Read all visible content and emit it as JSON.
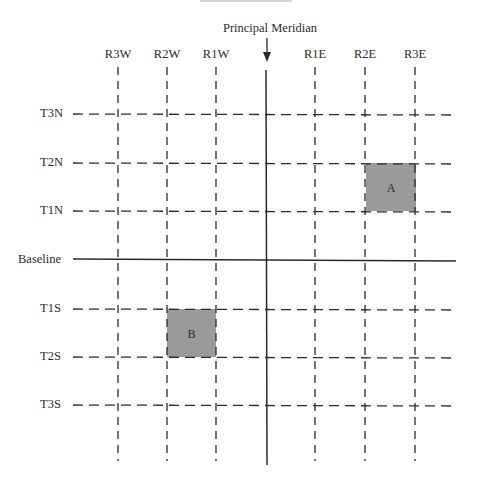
{
  "diagram": {
    "principal_meridian": {
      "label": "Principal Meridian",
      "x": 266,
      "arrow": "down-arrow"
    },
    "baseline": {
      "label": "Baseline",
      "y": 260
    },
    "ranges": [
      {
        "label": "R3W",
        "x": 118
      },
      {
        "label": "R2W",
        "x": 167
      },
      {
        "label": "R1W",
        "x": 216
      },
      {
        "label": "R1E",
        "x": 315
      },
      {
        "label": "R2E",
        "x": 365
      },
      {
        "label": "R3E",
        "x": 415
      }
    ],
    "townships": [
      {
        "label": "T3N",
        "y": 114
      },
      {
        "label": "T2N",
        "y": 163
      },
      {
        "label": "T1N",
        "y": 211
      },
      {
        "label": "T1S",
        "y": 309
      },
      {
        "label": "T2S",
        "y": 357
      },
      {
        "label": "T3S",
        "y": 405
      }
    ],
    "parcels": [
      {
        "label": "A",
        "x1": 366,
        "y1": 163,
        "x2": 416,
        "y2": 211,
        "fill": "#9a9a9a"
      },
      {
        "label": "B",
        "x1": 167,
        "y1": 309,
        "x2": 216,
        "y2": 357,
        "fill": "#9a9a9a"
      }
    ],
    "colors": {
      "line": "#2a2a2a",
      "parcel_fill": "#9a9a9a",
      "background": "#ffffff"
    }
  }
}
